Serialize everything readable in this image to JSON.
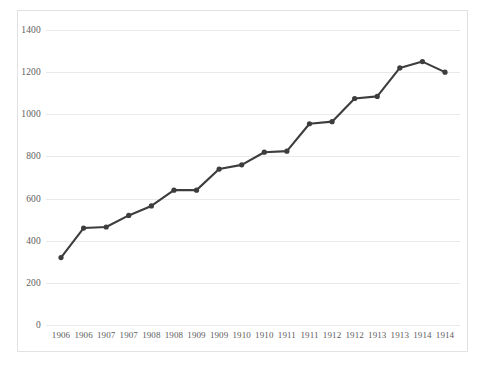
{
  "chart_data": {
    "type": "line",
    "title": "",
    "subtitle": "",
    "xlabel": "",
    "ylabel": "",
    "categories": [
      "1906",
      "1906",
      "1907",
      "1907",
      "1908",
      "1908",
      "1909",
      "1909",
      "1910",
      "1910",
      "1911",
      "1911",
      "1912",
      "1912",
      "1913",
      "1913",
      "1914",
      "1914"
    ],
    "series": [
      {
        "name": "",
        "values": [
          320,
          460,
          465,
          520,
          565,
          640,
          640,
          740,
          760,
          820,
          825,
          955,
          965,
          1075,
          1085,
          1220,
          1250,
          1200
        ]
      }
    ],
    "ylim": [
      0,
      1400
    ],
    "yticks": [
      0,
      200,
      400,
      600,
      800,
      1000,
      1200,
      1400
    ],
    "ytick_labels": [
      "0",
      "200",
      "400",
      "600",
      "800",
      "1000",
      "1200",
      "1400"
    ],
    "grid": true,
    "grid_axis": "y",
    "legend": false,
    "legend_position": "none",
    "markers": "circle",
    "colors": {
      "line": "#3d3d3d",
      "marker": "#3d3d3d",
      "gridline": "#e9e9e9",
      "frame_border": "#e2e2e2",
      "tick_text": "#5d5d5d",
      "background": "#ffffff"
    }
  }
}
